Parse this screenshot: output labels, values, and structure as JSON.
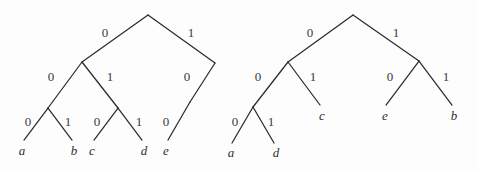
{
  "figure": {
    "background_color": "#fdfdfd",
    "line_color": "#2b2b2b",
    "label_color": "#3a3a3a",
    "leaf_color": "#2f2f2f",
    "width": 477,
    "height": 171
  },
  "trees": [
    {
      "id": "left-tree",
      "name": "binary-code-tree-left",
      "root": {
        "x": 148,
        "y": 15
      },
      "nodes": [
        {
          "id": "L-root",
          "x": 148,
          "y": 15
        },
        {
          "id": "L-n0",
          "x": 82,
          "y": 62
        },
        {
          "id": "L-n1",
          "x": 215,
          "y": 63
        },
        {
          "id": "L-n00",
          "x": 48,
          "y": 108
        },
        {
          "id": "L-n01",
          "x": 118,
          "y": 108
        },
        {
          "id": "L-n10",
          "x": 190,
          "y": 102
        }
      ],
      "edges": [
        {
          "id": "L-e-root-0",
          "from": {
            "x": 148,
            "y": 15
          },
          "to": {
            "x": 82,
            "y": 62
          },
          "bit": "0",
          "label_x": 105,
          "label_y": 37
        },
        {
          "id": "L-e-root-1",
          "from": {
            "x": 148,
            "y": 15
          },
          "to": {
            "x": 215,
            "y": 63
          },
          "bit": "1",
          "label_x": 191,
          "label_y": 37
        },
        {
          "id": "L-e-n0-0",
          "from": {
            "x": 82,
            "y": 62
          },
          "to": {
            "x": 48,
            "y": 108
          },
          "bit": "0",
          "label_x": 51,
          "label_y": 81
        },
        {
          "id": "L-e-n0-1",
          "from": {
            "x": 82,
            "y": 62
          },
          "to": {
            "x": 118,
            "y": 108
          },
          "bit": "1",
          "label_x": 110,
          "label_y": 81
        },
        {
          "id": "L-e-n1-0",
          "from": {
            "x": 215,
            "y": 63
          },
          "to": {
            "x": 190,
            "y": 102
          },
          "bit": "0",
          "label_x": 187,
          "label_y": 81
        },
        {
          "id": "L-e-n00-0",
          "from": {
            "x": 48,
            "y": 108
          },
          "to": {
            "x": 24,
            "y": 140
          },
          "bit": "0",
          "label_x": 28,
          "label_y": 126
        },
        {
          "id": "L-e-n00-1",
          "from": {
            "x": 48,
            "y": 108
          },
          "to": {
            "x": 72,
            "y": 140
          },
          "bit": "1",
          "label_x": 68,
          "label_y": 126
        },
        {
          "id": "L-e-n01-0",
          "from": {
            "x": 118,
            "y": 108
          },
          "to": {
            "x": 94,
            "y": 140
          },
          "bit": "0",
          "label_x": 97,
          "label_y": 126
        },
        {
          "id": "L-e-n01-1",
          "from": {
            "x": 118,
            "y": 108
          },
          "to": {
            "x": 142,
            "y": 140
          },
          "bit": "1",
          "label_x": 139,
          "label_y": 126
        },
        {
          "id": "L-e-n10-0",
          "from": {
            "x": 190,
            "y": 102
          },
          "to": {
            "x": 168,
            "y": 140
          },
          "bit": "0",
          "label_x": 166,
          "label_y": 126
        }
      ],
      "leaves": [
        {
          "id": "L-leaf-a",
          "label": "a",
          "x": 22,
          "y": 155
        },
        {
          "id": "L-leaf-b",
          "label": "b",
          "x": 74,
          "y": 155
        },
        {
          "id": "L-leaf-c",
          "label": "c",
          "x": 92,
          "y": 155
        },
        {
          "id": "L-leaf-d",
          "label": "d",
          "x": 144,
          "y": 155
        },
        {
          "id": "L-leaf-e",
          "label": "e",
          "x": 166,
          "y": 155
        }
      ]
    },
    {
      "id": "right-tree",
      "name": "binary-code-tree-right",
      "root": {
        "x": 353,
        "y": 15
      },
      "nodes": [
        {
          "id": "R-root",
          "x": 353,
          "y": 15
        },
        {
          "id": "R-n0",
          "x": 288,
          "y": 62
        },
        {
          "id": "R-n1",
          "x": 419,
          "y": 61
        },
        {
          "id": "R-n00",
          "x": 253,
          "y": 107
        }
      ],
      "edges": [
        {
          "id": "R-e-root-0",
          "from": {
            "x": 353,
            "y": 15
          },
          "to": {
            "x": 288,
            "y": 62
          },
          "bit": "0",
          "label_x": 310,
          "label_y": 37
        },
        {
          "id": "R-e-root-1",
          "from": {
            "x": 353,
            "y": 15
          },
          "to": {
            "x": 419,
            "y": 61
          },
          "bit": "1",
          "label_x": 396,
          "label_y": 37
        },
        {
          "id": "R-e-n0-0",
          "from": {
            "x": 288,
            "y": 62
          },
          "to": {
            "x": 253,
            "y": 107
          },
          "bit": "0",
          "label_x": 258,
          "label_y": 81
        },
        {
          "id": "R-e-n0-1",
          "from": {
            "x": 288,
            "y": 62
          },
          "to": {
            "x": 320,
            "y": 105
          },
          "bit": "1",
          "label_x": 313,
          "label_y": 81
        },
        {
          "id": "R-e-n1-0",
          "from": {
            "x": 419,
            "y": 61
          },
          "to": {
            "x": 386,
            "y": 105
          },
          "bit": "0",
          "label_x": 390,
          "label_y": 81
        },
        {
          "id": "R-e-n1-1",
          "from": {
            "x": 419,
            "y": 61
          },
          "to": {
            "x": 452,
            "y": 105
          },
          "bit": "1",
          "label_x": 446,
          "label_y": 81
        },
        {
          "id": "R-e-n00-0",
          "from": {
            "x": 253,
            "y": 107
          },
          "to": {
            "x": 232,
            "y": 143
          },
          "bit": "0",
          "label_x": 235,
          "label_y": 126
        },
        {
          "id": "R-e-n00-1",
          "from": {
            "x": 253,
            "y": 107
          },
          "to": {
            "x": 274,
            "y": 143
          },
          "bit": "1",
          "label_x": 271,
          "label_y": 126
        }
      ],
      "leaves": [
        {
          "id": "R-leaf-a",
          "label": "a",
          "x": 231,
          "y": 157
        },
        {
          "id": "R-leaf-d",
          "label": "d",
          "x": 276,
          "y": 157
        },
        {
          "id": "R-leaf-c",
          "label": "c",
          "x": 322,
          "y": 120
        },
        {
          "id": "R-leaf-e",
          "label": "e",
          "x": 385,
          "y": 120
        },
        {
          "id": "R-leaf-b",
          "label": "b",
          "x": 454,
          "y": 120
        }
      ]
    }
  ]
}
